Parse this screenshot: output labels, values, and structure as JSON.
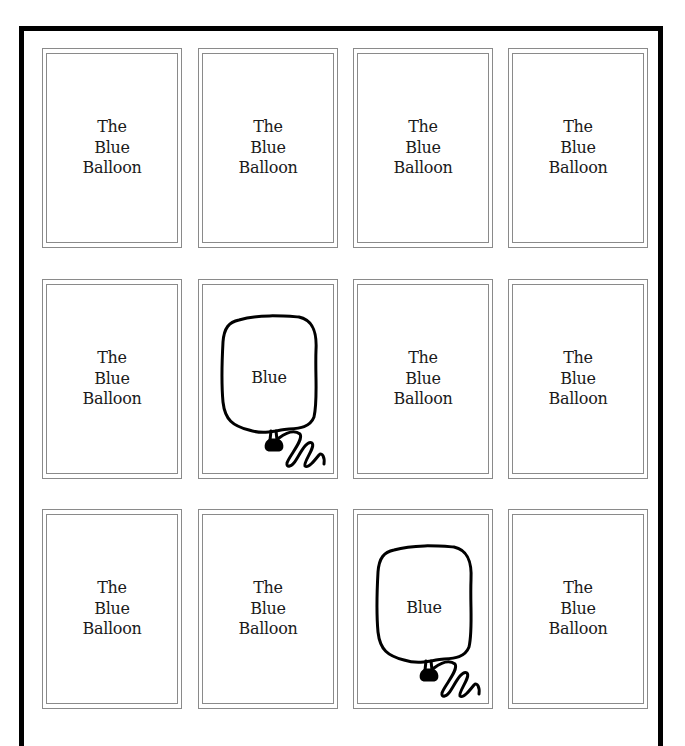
{
  "game": {
    "title": "The Blue Balloon",
    "grid": {
      "rows": 3,
      "cols": 4
    },
    "colors": {
      "frame": "#000000",
      "card_border": "#8a8a8a",
      "text": "#1a1a1a"
    },
    "cards": [
      {
        "row": 0,
        "col": 0,
        "state": "face-down",
        "lines": [
          "The",
          "Blue",
          "Balloon"
        ]
      },
      {
        "row": 0,
        "col": 1,
        "state": "face-down",
        "lines": [
          "The",
          "Blue",
          "Balloon"
        ]
      },
      {
        "row": 0,
        "col": 2,
        "state": "face-down",
        "lines": [
          "The",
          "Blue",
          "Balloon"
        ]
      },
      {
        "row": 0,
        "col": 3,
        "state": "face-down",
        "lines": [
          "The",
          "Blue",
          "Balloon"
        ]
      },
      {
        "row": 1,
        "col": 0,
        "state": "face-down",
        "lines": [
          "The",
          "Blue",
          "Balloon"
        ]
      },
      {
        "row": 1,
        "col": 1,
        "state": "face-up",
        "icon": "balloon-icon",
        "label": "Blue"
      },
      {
        "row": 1,
        "col": 2,
        "state": "face-down",
        "lines": [
          "The",
          "Blue",
          "Balloon"
        ]
      },
      {
        "row": 1,
        "col": 3,
        "state": "face-down",
        "lines": [
          "The",
          "Blue",
          "Balloon"
        ]
      },
      {
        "row": 2,
        "col": 0,
        "state": "face-down",
        "lines": [
          "The",
          "Blue",
          "Balloon"
        ]
      },
      {
        "row": 2,
        "col": 1,
        "state": "face-down",
        "lines": [
          "The",
          "Blue",
          "Balloon"
        ]
      },
      {
        "row": 2,
        "col": 2,
        "state": "face-up",
        "icon": "balloon-icon",
        "label": "Blue"
      },
      {
        "row": 2,
        "col": 3,
        "state": "face-down",
        "lines": [
          "The",
          "Blue",
          "Balloon"
        ]
      }
    ]
  }
}
